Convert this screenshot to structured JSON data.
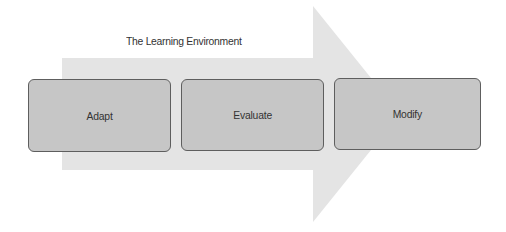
{
  "diagram": {
    "title": "The Learning Environment",
    "arrow": {
      "color": "#e4e4e4",
      "direction": "right"
    },
    "steps": [
      {
        "label": "Adapt"
      },
      {
        "label": "Evaluate"
      },
      {
        "label": "Modify"
      }
    ],
    "box_fill": "#c6c6c6",
    "box_border": "#5e5e5e"
  }
}
